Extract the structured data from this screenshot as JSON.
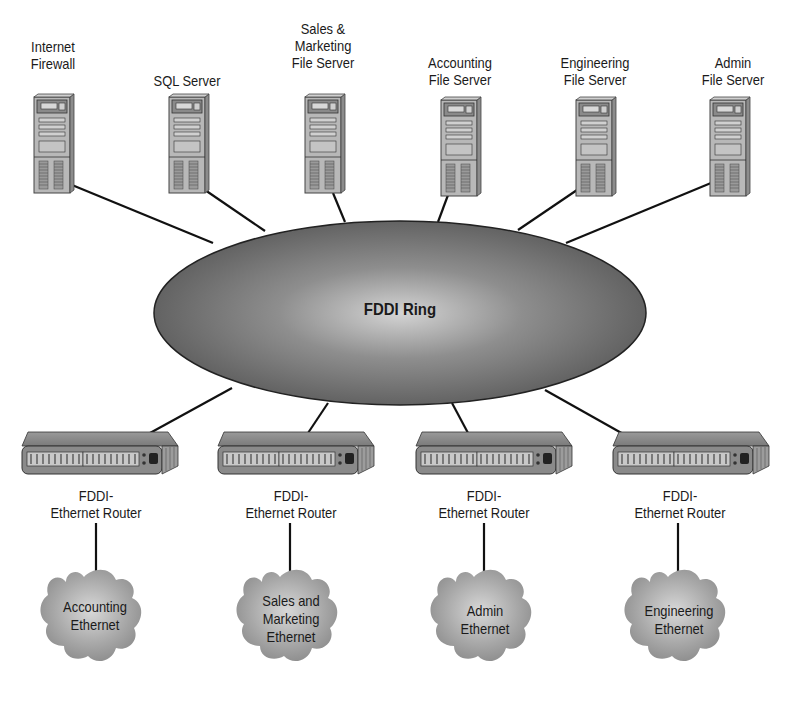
{
  "diagram": {
    "type": "network-topology",
    "ring": {
      "label": "FDDI Ring",
      "color": "#6e6e6e"
    },
    "servers": [
      {
        "label_lines": [
          "Internet",
          "Firewall"
        ],
        "x": 52
      },
      {
        "label_lines": [
          "SQL Server"
        ],
        "x": 187
      },
      {
        "label_lines": [
          "Sales &",
          "Marketing",
          "File Server"
        ],
        "x": 323
      },
      {
        "label_lines": [
          "Accounting",
          "File Server"
        ],
        "x": 459
      },
      {
        "label_lines": [
          "Engineering",
          "File Server"
        ],
        "x": 594
      },
      {
        "label_lines": [
          "Admin",
          "File Server"
        ],
        "x": 728
      }
    ],
    "routers": [
      {
        "label_lines": [
          "FDDI-",
          "Ethernet Router"
        ]
      },
      {
        "label_lines": [
          "FDDI-",
          "Ethernet Router"
        ]
      },
      {
        "label_lines": [
          "FDDI-",
          "Ethernet Router"
        ]
      },
      {
        "label_lines": [
          "FDDI-",
          "Ethernet Router"
        ]
      }
    ],
    "networks": [
      {
        "label_lines": [
          "Accounting",
          "Ethernet"
        ]
      },
      {
        "label_lines": [
          "Sales and",
          "Marketing",
          "Ethernet"
        ]
      },
      {
        "label_lines": [
          "Admin",
          "Ethernet"
        ]
      },
      {
        "label_lines": [
          "Engineering",
          "Ethernet"
        ]
      }
    ]
  },
  "labels": {
    "server_0": "Internet\nFirewall",
    "server_1": "SQL Server",
    "server_2": "Sales &\nMarketing\nFile Server",
    "server_3": "Accounting\nFile Server",
    "server_4": "Engineering\nFile Server",
    "server_5": "Admin\nFile Server",
    "ring": "FDDI Ring",
    "router": "FDDI-\nEthernet Router",
    "net_0": "Accounting\nEthernet",
    "net_1": "Sales and\nMarketing\nEthernet",
    "net_2": "Admin\nEthernet",
    "net_3": "Engineering\nEthernet"
  }
}
